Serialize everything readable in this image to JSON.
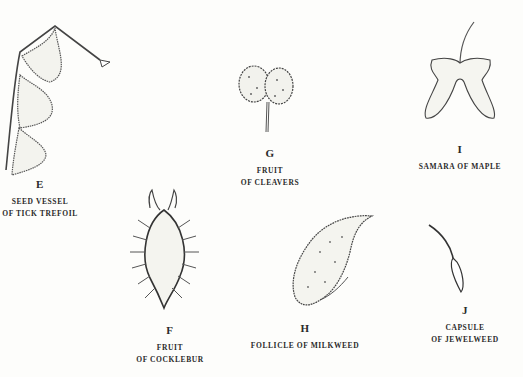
{
  "figures": [
    {
      "id": "E",
      "letter": "E",
      "lines": [
        "SEED VESSEL",
        "OF TICK TREFOIL"
      ]
    },
    {
      "id": "G",
      "letter": "G",
      "lines": [
        "FRUIT",
        "OF CLEAVERS"
      ]
    },
    {
      "id": "I",
      "letter": "I",
      "lines": [
        "SAMARA OF MAPLE"
      ]
    },
    {
      "id": "F",
      "letter": "F",
      "lines": [
        "FRUIT",
        "OF COCKLEBUR"
      ]
    },
    {
      "id": "H",
      "letter": "H",
      "lines": [
        "FOLLICLE OF MILKWEED"
      ]
    },
    {
      "id": "J",
      "letter": "J",
      "lines": [
        "CAPSULE",
        "OF JEWELWEED"
      ]
    }
  ],
  "colors": {
    "ink": "#2a2a2a",
    "paper": "#fdfdfb"
  }
}
